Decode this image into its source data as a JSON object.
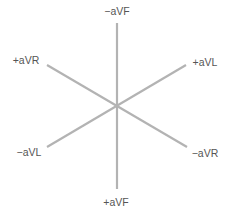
{
  "diagram": {
    "center": [
      117,
      106
    ],
    "line_color": "#b3b3b3",
    "label_color": "#555555",
    "axes": [
      {
        "name": "aVF",
        "from": [
          117,
          23
        ],
        "to": [
          117,
          189
        ]
      },
      {
        "name": "aVR",
        "from": [
          47,
          65
        ],
        "to": [
          187,
          147
        ]
      },
      {
        "name": "aVL",
        "from": [
          47,
          147
        ],
        "to": [
          186,
          65
        ]
      }
    ],
    "labels": {
      "neg_aVF": {
        "text": "−aVF",
        "x": 117,
        "y": 15
      },
      "pos_aVR": {
        "text": "+aVR",
        "x": 26,
        "y": 64
      },
      "pos_aVL": {
        "text": "+aVL",
        "x": 205,
        "y": 66
      },
      "neg_aVL": {
        "text": "−aVL",
        "x": 29,
        "y": 156
      },
      "neg_aVR": {
        "text": "−aVR",
        "x": 205,
        "y": 157
      },
      "pos_aVF": {
        "text": "+aVF",
        "x": 116,
        "y": 206
      }
    }
  }
}
